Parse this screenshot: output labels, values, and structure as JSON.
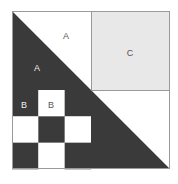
{
  "figure": {
    "outer_square": {
      "x": 12,
      "y": 11,
      "size": 158,
      "border_color": "#9a9a9a",
      "border_width": 1
    },
    "colors": {
      "dark": "#3a3a3a",
      "white": "#ffffff",
      "light_gray": "#e8e8e8",
      "outline": "#9a9a9a",
      "label_on_dark": "#f0f0f0",
      "label_on_light": "#555555"
    },
    "quadrants": {
      "top_left": {
        "name": "triangle-pair-a",
        "x": 12,
        "y": 11,
        "size": 79,
        "dark_triangle_points": "12,11 12,90 91,90",
        "white_triangle_points": "12,11 91,11 91,90"
      },
      "top_right": {
        "name": "square-c",
        "x": 91,
        "y": 11,
        "size": 79,
        "fill": "#e8e8e8"
      },
      "bottom_left": {
        "name": "checkerboard-b",
        "x": 12,
        "y": 90,
        "size": 79,
        "rows": 3,
        "cols": 3,
        "cell_size": 26.333,
        "pattern": [
          [
            "dark",
            "white",
            "dark"
          ],
          [
            "white",
            "dark",
            "white"
          ],
          [
            "dark",
            "white",
            "dark"
          ]
        ]
      },
      "bottom_right": {
        "name": "triangle-pair-lower",
        "x": 91,
        "y": 90,
        "size": 79,
        "dark_triangle_points": "91,90 91,169 170,169",
        "white_triangle_points": "91,90 170,90 170,169"
      }
    },
    "labels": [
      {
        "id": "a-white",
        "text": "A",
        "x": 66,
        "y": 37,
        "color": "#555555",
        "region": "top-left-white-triangle"
      },
      {
        "id": "a-dark",
        "text": "A",
        "x": 37,
        "y": 69,
        "color": "#f0f0f0",
        "region": "top-left-dark-triangle"
      },
      {
        "id": "c-gray",
        "text": "C",
        "x": 130,
        "y": 54,
        "color": "#555555",
        "region": "top-right-square"
      },
      {
        "id": "b-dark",
        "text": "B",
        "x": 24,
        "y": 106,
        "color": "#f0f0f0",
        "region": "checkerboard-cell-0-0"
      },
      {
        "id": "b-white",
        "text": "B",
        "x": 51,
        "y": 106,
        "color": "#555555",
        "region": "checkerboard-cell-0-1"
      }
    ]
  }
}
